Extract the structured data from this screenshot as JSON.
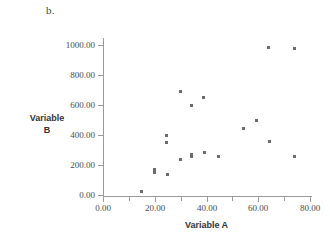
{
  "panel": {
    "label": "b."
  },
  "chart_data": {
    "type": "scatter",
    "title": "",
    "subtitle": "",
    "xlabel": "Variable A",
    "ylabel": "Variable B",
    "ylabel_lines": [
      "Variable",
      "B"
    ],
    "xlim": [
      0,
      80
    ],
    "ylim": [
      0,
      1000
    ],
    "grid": false,
    "legend": null,
    "x_ticks": [
      0,
      10,
      20,
      30,
      40,
      50,
      60,
      70,
      80
    ],
    "x_tick_labels": [
      "0.00",
      "",
      "20.00",
      "",
      "40.00",
      "",
      "60.00",
      "",
      "80.00"
    ],
    "x_major_ticks": [
      0,
      20,
      40,
      60,
      80
    ],
    "x_major_tick_labels": [
      "0.00",
      "20.00",
      "40.00",
      "60.00",
      "80.00"
    ],
    "y_ticks": [
      0,
      200,
      400,
      600,
      800,
      1000
    ],
    "y_tick_labels": [
      "0.00",
      "200.00",
      "400.00",
      "600.00",
      "800.00",
      "1000.00"
    ],
    "marker": "square",
    "marker_color": "#6b6b6b",
    "axis_color": "#9a9a9a",
    "points": [
      {
        "x": 14.8,
        "y": 22
      },
      {
        "x": 19.8,
        "y": 168
      },
      {
        "x": 19.8,
        "y": 152
      },
      {
        "x": 24.6,
        "y": 398
      },
      {
        "x": 24.6,
        "y": 352
      },
      {
        "x": 24.8,
        "y": 137
      },
      {
        "x": 29.8,
        "y": 688
      },
      {
        "x": 29.8,
        "y": 237
      },
      {
        "x": 34.0,
        "y": 598
      },
      {
        "x": 34.2,
        "y": 272
      },
      {
        "x": 34.2,
        "y": 258
      },
      {
        "x": 39.0,
        "y": 648
      },
      {
        "x": 39.2,
        "y": 281
      },
      {
        "x": 44.8,
        "y": 260
      },
      {
        "x": 54.2,
        "y": 443
      },
      {
        "x": 59.3,
        "y": 496
      },
      {
        "x": 63.8,
        "y": 981
      },
      {
        "x": 64.4,
        "y": 354
      },
      {
        "x": 73.8,
        "y": 975
      },
      {
        "x": 74.0,
        "y": 254
      }
    ]
  }
}
